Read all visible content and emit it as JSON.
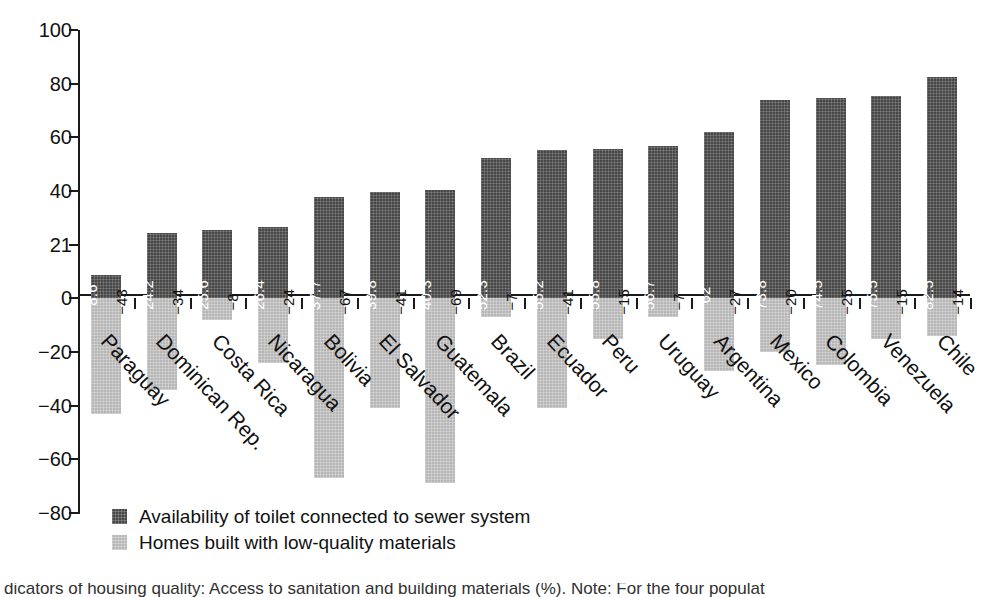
{
  "chart_data": {
    "type": "bar",
    "title": "",
    "xlabel": "",
    "ylabel": "",
    "ylim": [
      -80,
      100
    ],
    "grid": false,
    "legend_position": "bottom-left",
    "y_ticks": [
      "100",
      "80",
      "60",
      "40",
      "21",
      "0",
      "-20",
      "-40",
      "-60",
      "-80"
    ],
    "y_tick_values": [
      100,
      80,
      60,
      40,
      20,
      0,
      -20,
      -40,
      -60,
      -80
    ],
    "categories": [
      "Paraguay",
      "Dominican Rep.",
      "Costa Rica",
      "Nicaragua",
      "Bolivia",
      "El Salvador",
      "Guatemala",
      "Brazil",
      "Ecuador",
      "Peru",
      "Uruguay",
      "Argentina",
      "Mexico",
      "Colombia",
      "Venezuela",
      "Chile"
    ],
    "series": [
      {
        "name": "Availability of toilet connected to sewer system",
        "color": "#474747",
        "values": [
          8.6,
          24.2,
          25.6,
          26.4,
          37.7,
          39.8,
          40.3,
          52.3,
          55.2,
          55.8,
          56.7,
          62,
          73.8,
          74.5,
          75.5,
          82.5
        ],
        "labels": [
          "8.6",
          "24.2",
          "25.6",
          "26.4",
          "37.7",
          "39.8",
          "40.3",
          "52.3",
          "55.2",
          "55.8",
          "56.7",
          "62",
          "73.8",
          "74.5",
          "75.5",
          "82.5"
        ]
      },
      {
        "name": "Homes built with low-quality materials",
        "color": "#b6b6b6",
        "values": [
          -43,
          -34,
          -8,
          -24,
          -67,
          -41,
          -69,
          -7,
          -41,
          -15,
          -7,
          -27,
          -20,
          -25,
          -15,
          -14
        ],
        "labels": [
          "-43",
          "-34",
          "-8",
          "-24",
          "-67",
          "-41",
          "-69",
          "-7",
          "-41",
          "-15",
          "-7",
          "-27",
          "-20",
          "-25",
          "-15",
          "-14"
        ]
      }
    ]
  },
  "legend": {
    "items": [
      {
        "label": "Availability of toilet connected to sewer system"
      },
      {
        "label": "Homes built with low-quality materials"
      }
    ]
  },
  "caption": {
    "text": "dicators of housing quality: Access to sanitation and building materials (%). Note: For the four populat"
  }
}
